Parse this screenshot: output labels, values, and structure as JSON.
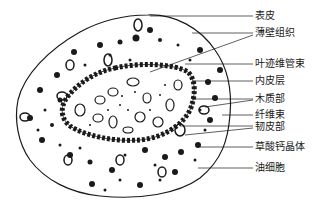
{
  "figure": {
    "ink_color": "#1a1a1a",
    "background": "#ffffff"
  },
  "labels": [
    {
      "id": "epidermis",
      "text": "表皮",
      "y": 16
    },
    {
      "id": "parenchyma",
      "text": "薄壁组织",
      "y": 33
    },
    {
      "id": "leaf-trace-bundle",
      "text": "叶迹维管束",
      "y": 64
    },
    {
      "id": "endodermis",
      "text": "内皮层",
      "y": 81
    },
    {
      "id": "xylem",
      "text": "木质部",
      "y": 99
    },
    {
      "id": "fiber-bundle",
      "text": "纤维束",
      "y": 115
    },
    {
      "id": "phloem",
      "text": "韧皮部",
      "y": 127
    },
    {
      "id": "calcium-oxalate-crystal",
      "text": "草酸钙晶体",
      "y": 147
    },
    {
      "id": "oil-cell",
      "text": "油细胞",
      "y": 168
    }
  ]
}
